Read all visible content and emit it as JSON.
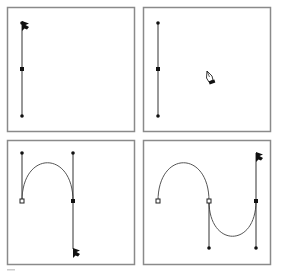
{
  "figure": {
    "colors": {
      "frame": "#8a8a8a",
      "line": "#333333",
      "curve": "#555555",
      "point": "#111111",
      "background": "#ffffff"
    },
    "panels": [
      {
        "id": "step-1",
        "position": "top-left",
        "cursor": "arrow-icon",
        "elements": [
          "vertical direction line",
          "filled anchor point",
          "two direction-handle endpoints"
        ]
      },
      {
        "id": "step-2",
        "position": "top-right",
        "cursor": "pen-icon",
        "elements": [
          "vertical direction line",
          "filled anchor point",
          "two direction-handle endpoints"
        ]
      },
      {
        "id": "step-3",
        "position": "bottom-left",
        "cursor": "arrow-icon",
        "elements": [
          "first hollow anchor",
          "arch curve segment",
          "second filled anchor with vertical direction line"
        ]
      },
      {
        "id": "step-4",
        "position": "bottom-right",
        "cursor": "arrow-icon",
        "elements": [
          "hollow anchor",
          "arch curve",
          "hollow anchor",
          "valley curve",
          "filled anchor with vertical direction line"
        ]
      }
    ],
    "caption": ""
  }
}
